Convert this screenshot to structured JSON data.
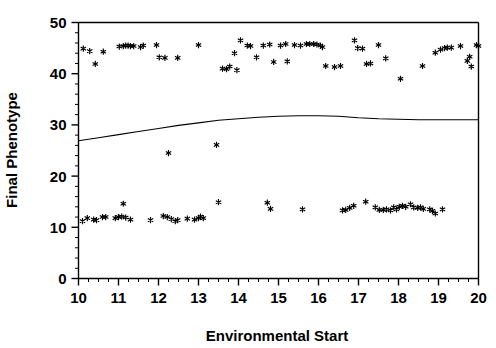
{
  "chart_data": {
    "type": "scatter",
    "title": "",
    "xlabel": "Environmental Start",
    "ylabel": "Final Phenotype",
    "xlim": [
      10,
      20
    ],
    "ylim": [
      0,
      50
    ],
    "xticks": [
      10,
      11,
      12,
      13,
      14,
      15,
      16,
      17,
      18,
      19,
      20
    ],
    "xtick_labels": [
      "10",
      "11",
      "12",
      "13",
      "14",
      "15",
      "16",
      "17",
      "18",
      "19",
      "20"
    ],
    "yticks": [
      0,
      10,
      20,
      30,
      40,
      50
    ],
    "ytick_labels": [
      "0",
      "10",
      "20",
      "30",
      "40",
      "50"
    ],
    "minor_tick_interval_x": 0.25,
    "minor_tick_interval_y": 2,
    "grid": false,
    "legend": null,
    "marker_symbol": "asterisk",
    "marker_color": "#000000",
    "series": [
      {
        "name": "Final Phenotype",
        "marker": "asterisk",
        "points": [
          [
            10.12,
            44.9
          ],
          [
            10.28,
            44.4
          ],
          [
            10.42,
            41.9
          ],
          [
            10.62,
            44.3
          ],
          [
            11.02,
            45.3
          ],
          [
            11.12,
            45.4
          ],
          [
            11.18,
            45.5
          ],
          [
            11.24,
            45.5
          ],
          [
            11.3,
            45.4
          ],
          [
            11.38,
            45.4
          ],
          [
            11.55,
            45.2
          ],
          [
            11.62,
            45.5
          ],
          [
            11.95,
            45.6
          ],
          [
            12.02,
            43.2
          ],
          [
            12.16,
            43.1
          ],
          [
            12.25,
            24.5
          ],
          [
            12.48,
            43.1
          ],
          [
            13.0,
            45.6
          ],
          [
            13.45,
            26.1
          ],
          [
            13.6,
            41.0
          ],
          [
            13.7,
            40.9
          ],
          [
            13.78,
            41.4
          ],
          [
            13.9,
            44.0
          ],
          [
            13.96,
            40.7
          ],
          [
            14.05,
            46.5
          ],
          [
            14.22,
            45.5
          ],
          [
            14.3,
            45.4
          ],
          [
            14.45,
            43.2
          ],
          [
            14.62,
            45.5
          ],
          [
            14.78,
            45.7
          ],
          [
            14.88,
            42.3
          ],
          [
            15.05,
            45.5
          ],
          [
            15.18,
            45.8
          ],
          [
            15.22,
            42.4
          ],
          [
            15.4,
            45.6
          ],
          [
            15.55,
            45.5
          ],
          [
            15.7,
            45.8
          ],
          [
            15.78,
            45.8
          ],
          [
            15.88,
            45.8
          ],
          [
            15.96,
            45.7
          ],
          [
            16.05,
            45.5
          ],
          [
            16.1,
            45.2
          ],
          [
            16.18,
            41.5
          ],
          [
            16.4,
            41.3
          ],
          [
            16.55,
            41.5
          ],
          [
            16.9,
            46.5
          ],
          [
            16.98,
            45.0
          ],
          [
            17.1,
            44.9
          ],
          [
            17.2,
            41.9
          ],
          [
            17.3,
            42.0
          ],
          [
            17.5,
            45.6
          ],
          [
            17.68,
            43.0
          ],
          [
            18.05,
            39.0
          ],
          [
            18.6,
            41.5
          ],
          [
            18.92,
            44.1
          ],
          [
            19.05,
            44.7
          ],
          [
            19.15,
            45.0
          ],
          [
            19.22,
            45.1
          ],
          [
            19.32,
            45.1
          ],
          [
            19.55,
            45.4
          ],
          [
            19.72,
            42.5
          ],
          [
            19.78,
            43.3
          ],
          [
            19.82,
            41.4
          ],
          [
            19.95,
            45.6
          ],
          [
            20.0,
            45.4
          ],
          [
            10.1,
            11.2
          ],
          [
            10.22,
            11.8
          ],
          [
            10.38,
            11.5
          ],
          [
            10.45,
            11.4
          ],
          [
            10.6,
            12.0
          ],
          [
            10.68,
            12.0
          ],
          [
            10.92,
            11.8
          ],
          [
            11.0,
            12.0
          ],
          [
            11.08,
            12.1
          ],
          [
            11.12,
            14.6
          ],
          [
            11.18,
            11.9
          ],
          [
            11.3,
            11.5
          ],
          [
            11.8,
            11.4
          ],
          [
            12.12,
            12.2
          ],
          [
            12.22,
            12.0
          ],
          [
            12.32,
            11.6
          ],
          [
            12.42,
            11.2
          ],
          [
            12.48,
            11.4
          ],
          [
            12.72,
            11.7
          ],
          [
            12.9,
            11.5
          ],
          [
            13.0,
            11.8
          ],
          [
            13.05,
            12.1
          ],
          [
            13.12,
            11.8
          ],
          [
            13.5,
            14.9
          ],
          [
            14.72,
            14.8
          ],
          [
            14.8,
            13.6
          ],
          [
            15.6,
            13.5
          ],
          [
            16.6,
            13.3
          ],
          [
            16.68,
            13.4
          ],
          [
            16.78,
            13.8
          ],
          [
            16.88,
            14.2
          ],
          [
            17.18,
            15.0
          ],
          [
            17.42,
            13.9
          ],
          [
            17.52,
            13.4
          ],
          [
            17.62,
            13.4
          ],
          [
            17.7,
            13.5
          ],
          [
            17.8,
            13.3
          ],
          [
            17.88,
            13.9
          ],
          [
            17.95,
            13.5
          ],
          [
            18.02,
            14.0
          ],
          [
            18.1,
            14.2
          ],
          [
            18.18,
            14.0
          ],
          [
            18.3,
            14.5
          ],
          [
            18.38,
            13.9
          ],
          [
            18.48,
            13.8
          ],
          [
            18.55,
            13.9
          ],
          [
            18.62,
            13.6
          ],
          [
            18.78,
            13.5
          ],
          [
            18.85,
            13.2
          ],
          [
            18.92,
            12.7
          ],
          [
            19.1,
            13.5
          ]
        ]
      }
    ],
    "trend_line": {
      "name": "fitted-curve",
      "points": [
        [
          10.0,
          26.9
        ],
        [
          10.5,
          27.5
        ],
        [
          11.0,
          28.1
        ],
        [
          11.5,
          28.7
        ],
        [
          12.0,
          29.3
        ],
        [
          12.5,
          29.9
        ],
        [
          13.0,
          30.4
        ],
        [
          13.5,
          30.9
        ],
        [
          14.0,
          31.2
        ],
        [
          14.5,
          31.5
        ],
        [
          15.0,
          31.7
        ],
        [
          15.5,
          31.8
        ],
        [
          16.0,
          31.8
        ],
        [
          16.5,
          31.7
        ],
        [
          17.0,
          31.4
        ],
        [
          17.5,
          31.2
        ],
        [
          18.0,
          31.1
        ],
        [
          18.5,
          31.0
        ],
        [
          19.0,
          31.0
        ],
        [
          19.5,
          31.0
        ],
        [
          20.0,
          31.0
        ]
      ]
    }
  },
  "axes": {
    "x_title": "Environmental Start",
    "y_title": "Final Phenotype"
  }
}
